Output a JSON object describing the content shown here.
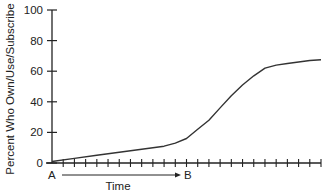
{
  "chart_data": {
    "type": "line",
    "title": "",
    "xlabel": "Time",
    "ylabel": "Percent Who Own/Use/Subscribe",
    "ylim": [
      0,
      100
    ],
    "yticks": [
      0,
      20,
      40,
      60,
      80,
      100
    ],
    "ytick_labels": [
      "0",
      "20",
      "40",
      "60",
      "80",
      "100"
    ],
    "x_start_label": "A",
    "x_end_label": "B",
    "x_arrow": "A → B indicates direction of time",
    "x_tick_count": 24,
    "grid": false,
    "legend": null,
    "series": [
      {
        "name": "Adoption",
        "color": "#333333",
        "x": [
          0,
          2,
          4,
          6,
          8,
          10,
          11,
          12,
          13,
          14,
          15,
          16,
          17,
          18,
          19,
          20,
          21,
          22,
          23,
          24
        ],
        "values": [
          1,
          3,
          5,
          7,
          9,
          11,
          13,
          16,
          22,
          28,
          36,
          44,
          51,
          57,
          62,
          64,
          65,
          66,
          67,
          67.5
        ]
      }
    ]
  }
}
